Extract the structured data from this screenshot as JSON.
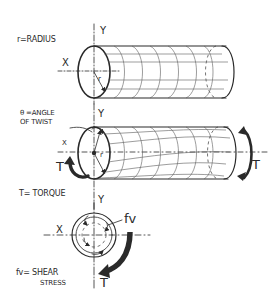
{
  "diagram": {
    "colors": {
      "ink": "#2a2a2a",
      "arrow": "#333333",
      "background": "#ffffff"
    },
    "panel_top": {
      "label_radius": "r=RADIUS",
      "axis_y": "Y",
      "axis_x": "X",
      "radius_symbol": "r"
    },
    "panel_middle": {
      "label_angle_line1": "θ =ANGLE",
      "label_angle_line2": "OF TWIST",
      "axis_y": "Y",
      "axis_x": "X",
      "radius_symbol": "r",
      "torque_left": "T",
      "torque_right": "T",
      "label_torque": "T= TORQUE",
      "axis_y_bottom": "Y"
    },
    "panel_bottom": {
      "axis_y": "Y",
      "axis_x": "X",
      "shear_symbol": "fv",
      "label_shear_line1": "fv= SHEAR",
      "label_shear_line2": "STRESS",
      "torque": "T"
    }
  }
}
